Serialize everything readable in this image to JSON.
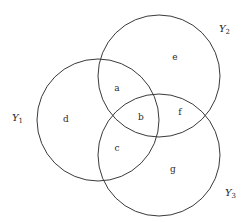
{
  "diagram": {
    "type": "venn",
    "sets": [
      {
        "id": "Y1",
        "name": "Y",
        "subscript": "1",
        "cx": 98,
        "cy": 120,
        "r": 61,
        "label_x": 12,
        "label_y": 121
      },
      {
        "id": "Y2",
        "name": "Y",
        "subscript": "2",
        "cx": 159,
        "cy": 76,
        "r": 61,
        "label_x": 219,
        "label_y": 32
      },
      {
        "id": "Y3",
        "name": "Y",
        "subscript": "3",
        "cx": 159,
        "cy": 155,
        "r": 61,
        "label_x": 225,
        "label_y": 196
      }
    ],
    "regions": [
      {
        "label": "a",
        "x": 117,
        "y": 91,
        "description": "Y1 ∩ Y2 only"
      },
      {
        "label": "b",
        "x": 141,
        "y": 120,
        "description": "Y1 ∩ Y2 ∩ Y3"
      },
      {
        "label": "c",
        "x": 117,
        "y": 151,
        "description": "Y1 ∩ Y3 only"
      },
      {
        "label": "d",
        "x": 66,
        "y": 122,
        "description": "Y1 only"
      },
      {
        "label": "e",
        "x": 175,
        "y": 60,
        "description": "Y2 only"
      },
      {
        "label": "f",
        "x": 180,
        "y": 115,
        "description": "Y2 ∩ Y3 only"
      },
      {
        "label": "g",
        "x": 173,
        "y": 172,
        "description": "Y3 only"
      }
    ],
    "stroke_color": "#3a3a3a",
    "background": "#ffffff"
  }
}
